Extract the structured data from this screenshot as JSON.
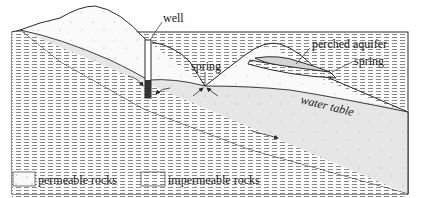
{
  "diagram": {
    "type": "geological cross-section",
    "labels": {
      "well": "well",
      "spring_left": "spring",
      "perched_aquifer": "perched aquifer",
      "spring_right": "spring",
      "water_table": "water table"
    },
    "legend": [
      {
        "key": "permeable",
        "label": "permeable rocks",
        "pattern": "dotted"
      },
      {
        "key": "impermeable",
        "label": "impermeable rocks",
        "pattern": "dashed-lines"
      }
    ],
    "colors": {
      "line": "#2a2a2a",
      "saturated_zone": "#e6e6e6",
      "unsaturated_zone": "#fafafa",
      "perched_water": "#d4d4d4",
      "well_water": "#333333"
    }
  }
}
